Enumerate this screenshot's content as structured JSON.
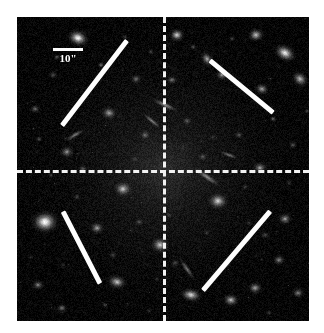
{
  "figure": {
    "kind": "astronomical-image",
    "background_color": "#ffffff",
    "sky_background_color": "#050505",
    "annotation_color": "#fdfdfd"
  },
  "scalebar": {
    "label": "10\"",
    "length_px": 30,
    "x": 36,
    "y": 31
  },
  "crosshair": {
    "color": "#f2f2f2",
    "dash_length_px": 8,
    "gap_length_px": 4,
    "vertical_x_px": 146,
    "horizontal_y_px": 153
  },
  "orientation_bars": [
    {
      "name": "upper-left-bar",
      "x1": 45,
      "y1": 108,
      "x2": 110,
      "y2": 23,
      "color": "#fdfdfd"
    },
    {
      "name": "upper-right-bar",
      "x1": 193,
      "y1": 43,
      "x2": 256,
      "y2": 95,
      "color": "#fdfdfd"
    },
    {
      "name": "lower-left-bar",
      "x1": 46,
      "y1": 194,
      "x2": 83,
      "y2": 266,
      "color": "#fdfdfd"
    },
    {
      "name": "lower-right-bar",
      "x1": 186,
      "y1": 273,
      "x2": 253,
      "y2": 194,
      "color": "#fdfdfd"
    }
  ],
  "chart_data": {
    "type": "scatter",
    "title": "",
    "xlabel": "",
    "ylabel": "",
    "note": "Positions are in sky-frame pixel coordinates relative to the image panel (292x304). 'b' is brightness 0-1, 'r' is radius in px, 'e' is ellipticity, 'a' is position angle in degrees.",
    "center_halo": {
      "x": 146,
      "y": 153,
      "r": 80,
      "b": 0.3
    },
    "galaxies": [
      {
        "x": 61,
        "y": 21,
        "r": 13,
        "b": 0.95,
        "e": 0.75,
        "a": 20
      },
      {
        "x": 239,
        "y": 18,
        "r": 10,
        "b": 0.8,
        "e": 0.85,
        "a": 0
      },
      {
        "x": 268,
        "y": 36,
        "r": 14,
        "b": 0.92,
        "e": 0.7,
        "a": 30
      },
      {
        "x": 283,
        "y": 62,
        "r": 11,
        "b": 0.78,
        "e": 0.8,
        "a": 45
      },
      {
        "x": 245,
        "y": 72,
        "r": 9,
        "b": 0.7,
        "e": 0.85,
        "a": 10
      },
      {
        "x": 160,
        "y": 18,
        "r": 9,
        "b": 0.85,
        "e": 0.9,
        "a": 0
      },
      {
        "x": 190,
        "y": 42,
        "r": 10,
        "b": 0.72,
        "e": 0.75,
        "a": 60
      },
      {
        "x": 205,
        "y": 58,
        "r": 8,
        "b": 0.68,
        "e": 0.85,
        "a": 0
      },
      {
        "x": 28,
        "y": 205,
        "r": 16,
        "b": 0.98,
        "e": 0.85,
        "a": 0
      },
      {
        "x": 50,
        "y": 135,
        "r": 9,
        "b": 0.66,
        "e": 0.85,
        "a": 0
      },
      {
        "x": 92,
        "y": 96,
        "r": 10,
        "b": 0.72,
        "e": 0.8,
        "a": 15
      },
      {
        "x": 119,
        "y": 62,
        "r": 7,
        "b": 0.6,
        "e": 0.85,
        "a": 0
      },
      {
        "x": 106,
        "y": 172,
        "r": 11,
        "b": 0.8,
        "e": 0.85,
        "a": 0
      },
      {
        "x": 80,
        "y": 211,
        "r": 9,
        "b": 0.7,
        "e": 0.85,
        "a": 0
      },
      {
        "x": 143,
        "y": 228,
        "r": 11,
        "b": 0.82,
        "e": 0.85,
        "a": 0
      },
      {
        "x": 100,
        "y": 265,
        "r": 12,
        "b": 0.8,
        "e": 0.7,
        "a": 15
      },
      {
        "x": 174,
        "y": 278,
        "r": 13,
        "b": 0.86,
        "e": 0.65,
        "a": 10
      },
      {
        "x": 214,
        "y": 283,
        "r": 10,
        "b": 0.78,
        "e": 0.8,
        "a": 0
      },
      {
        "x": 238,
        "y": 271,
        "r": 9,
        "b": 0.72,
        "e": 0.85,
        "a": 0
      },
      {
        "x": 201,
        "y": 184,
        "r": 12,
        "b": 0.84,
        "e": 0.85,
        "a": 0
      },
      {
        "x": 243,
        "y": 151,
        "r": 9,
        "b": 0.7,
        "e": 0.85,
        "a": 0
      },
      {
        "x": 268,
        "y": 202,
        "r": 9,
        "b": 0.68,
        "e": 0.85,
        "a": 0
      },
      {
        "x": 262,
        "y": 243,
        "r": 8,
        "b": 0.64,
        "e": 0.85,
        "a": 0
      },
      {
        "x": 281,
        "y": 276,
        "r": 8,
        "b": 0.62,
        "e": 0.85,
        "a": 0
      },
      {
        "x": 21,
        "y": 268,
        "r": 8,
        "b": 0.62,
        "e": 0.8,
        "a": 0
      },
      {
        "x": 45,
        "y": 291,
        "r": 7,
        "b": 0.58,
        "e": 0.85,
        "a": 0
      },
      {
        "x": 18,
        "y": 92,
        "r": 7,
        "b": 0.55,
        "e": 0.85,
        "a": 0
      },
      {
        "x": 36,
        "y": 58,
        "r": 6,
        "b": 0.5,
        "e": 0.85,
        "a": 0
      },
      {
        "x": 128,
        "y": 118,
        "r": 7,
        "b": 0.58,
        "e": 0.85,
        "a": 0
      },
      {
        "x": 170,
        "y": 104,
        "r": 6,
        "b": 0.54,
        "e": 0.85,
        "a": 0
      },
      {
        "x": 155,
        "y": 63,
        "r": 7,
        "b": 0.6,
        "e": 0.8,
        "a": 0
      },
      {
        "x": 186,
        "y": 140,
        "r": 6,
        "b": 0.52,
        "e": 0.85,
        "a": 0
      },
      {
        "x": 222,
        "y": 118,
        "r": 6,
        "b": 0.5,
        "e": 0.85,
        "a": 0
      },
      {
        "x": 66,
        "y": 152,
        "r": 6,
        "b": 0.52,
        "e": 0.85,
        "a": 0
      },
      {
        "x": 122,
        "y": 205,
        "r": 6,
        "b": 0.5,
        "e": 0.85,
        "a": 0
      },
      {
        "x": 158,
        "y": 246,
        "r": 6,
        "b": 0.48,
        "e": 0.85,
        "a": 0
      },
      {
        "x": 248,
        "y": 218,
        "r": 6,
        "b": 0.48,
        "e": 0.85,
        "a": 0
      },
      {
        "x": 96,
        "y": 238,
        "r": 6,
        "b": 0.46,
        "e": 0.85,
        "a": 0
      },
      {
        "x": 210,
        "y": 246,
        "r": 6,
        "b": 0.46,
        "e": 0.85,
        "a": 0
      },
      {
        "x": 276,
        "y": 128,
        "r": 6,
        "b": 0.48,
        "e": 0.85,
        "a": 0
      }
    ],
    "point_sources": [
      {
        "x": 40,
        "y": 40,
        "b": 0.55
      },
      {
        "x": 84,
        "y": 48,
        "b": 0.6
      },
      {
        "x": 134,
        "y": 35,
        "b": 0.5
      },
      {
        "x": 176,
        "y": 30,
        "b": 0.52
      },
      {
        "x": 215,
        "y": 22,
        "b": 0.48
      },
      {
        "x": 256,
        "y": 102,
        "b": 0.58
      },
      {
        "x": 22,
        "y": 122,
        "b": 0.52
      },
      {
        "x": 60,
        "y": 180,
        "b": 0.5
      },
      {
        "x": 34,
        "y": 158,
        "b": 0.46
      },
      {
        "x": 118,
        "y": 142,
        "b": 0.44
      },
      {
        "x": 152,
        "y": 198,
        "b": 0.46
      },
      {
        "x": 190,
        "y": 216,
        "b": 0.44
      },
      {
        "x": 228,
        "y": 170,
        "b": 0.46
      },
      {
        "x": 272,
        "y": 166,
        "b": 0.42
      },
      {
        "x": 88,
        "y": 288,
        "b": 0.46
      },
      {
        "x": 132,
        "y": 294,
        "b": 0.42
      },
      {
        "x": 252,
        "y": 296,
        "b": 0.44
      },
      {
        "x": 196,
        "y": 120,
        "b": 0.4
      },
      {
        "x": 70,
        "y": 76,
        "b": 0.42
      },
      {
        "x": 108,
        "y": 20,
        "b": 0.44
      },
      {
        "x": 290,
        "y": 94,
        "b": 0.46
      },
      {
        "x": 14,
        "y": 240,
        "b": 0.4
      },
      {
        "x": 166,
        "y": 130,
        "b": 0.38
      },
      {
        "x": 232,
        "y": 206,
        "b": 0.4
      },
      {
        "x": 46,
        "y": 248,
        "b": 0.38
      },
      {
        "x": 140,
        "y": 262,
        "b": 0.4
      }
    ],
    "arcs": [
      {
        "x": 148,
        "y": 88,
        "len": 16,
        "a": 25,
        "b": 0.55
      },
      {
        "x": 135,
        "y": 104,
        "len": 13,
        "a": 40,
        "b": 0.5
      },
      {
        "x": 190,
        "y": 160,
        "len": 18,
        "a": 35,
        "b": 0.52
      },
      {
        "x": 58,
        "y": 118,
        "len": 14,
        "a": -30,
        "b": 0.48
      },
      {
        "x": 170,
        "y": 252,
        "len": 15,
        "a": 55,
        "b": 0.46
      },
      {
        "x": 212,
        "y": 138,
        "len": 12,
        "a": 20,
        "b": 0.44
      }
    ]
  }
}
